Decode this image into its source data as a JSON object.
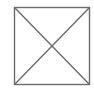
{
  "diagram": {
    "shape": "crossed-square",
    "box": {
      "x": 14.5,
      "y": 7.5,
      "width": 75,
      "height": 77
    },
    "stroke_color": "#6b6b6b",
    "stroke_width": 1.4,
    "background": "#ffffff"
  }
}
